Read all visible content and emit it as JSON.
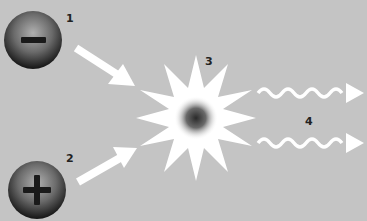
{
  "diagram": {
    "title_cropped": true,
    "background_color": "#c4c4c4",
    "elements": [
      {
        "id": 1,
        "label": "1",
        "type": "particle",
        "symbol": "minus",
        "charge": "negative"
      },
      {
        "id": 2,
        "label": "2",
        "type": "particle",
        "symbol": "plus",
        "charge": "positive"
      },
      {
        "id": 3,
        "label": "3",
        "type": "annihilation-burst"
      },
      {
        "id": 4,
        "label": "4",
        "type": "emitted-waves",
        "count": 2
      }
    ],
    "arrows": [
      {
        "from": "1",
        "to": "3",
        "style": "straight"
      },
      {
        "from": "2",
        "to": "3",
        "style": "straight"
      },
      {
        "from": "3",
        "to": "right",
        "style": "wavy"
      },
      {
        "from": "3",
        "to": "right",
        "style": "wavy"
      }
    ],
    "colors": {
      "arrow": "#ffffff",
      "particle_dark": "#1a1a1a",
      "particle_light": "#9a9a9a",
      "burst": "#ffffff",
      "label": "#222222"
    }
  },
  "labels": {
    "l1": "1",
    "l2": "2",
    "l3": "3",
    "l4": "4"
  }
}
